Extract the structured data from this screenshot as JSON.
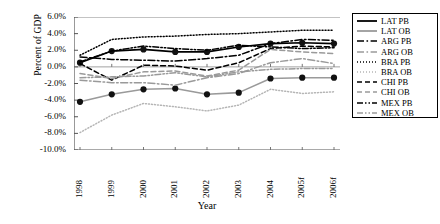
{
  "chart_data": {
    "type": "line",
    "title": "",
    "xlabel": "Year",
    "ylabel": "Percent of GDP",
    "grid": false,
    "legend_position": "right",
    "x": [
      "1998",
      "1999",
      "2000",
      "2001",
      "2002",
      "2003",
      "2004",
      "2005f",
      "2006f"
    ],
    "ylim": [
      -10.0,
      6.0
    ],
    "ytick_labels": [
      "6.0%",
      "4.0%",
      "2.0%",
      "0.0%",
      "-2.0%",
      "-4.0%",
      "-6.0%",
      "-8.0%",
      "-10.0%"
    ],
    "ytick_values": [
      6.0,
      4.0,
      2.0,
      0.0,
      -2.0,
      -4.0,
      -6.0,
      -8.0,
      -10.0
    ],
    "series": [
      {
        "name": "LAT PB",
        "color": "#000000",
        "style": "solid",
        "markers": true,
        "values": [
          0.5,
          1.9,
          2.1,
          1.8,
          1.8,
          2.4,
          2.8,
          2.9,
          2.8
        ]
      },
      {
        "name": "LAT OB",
        "color": "#9a9a9a",
        "style": "solid",
        "markers": true,
        "values": [
          -4.2,
          -3.3,
          -2.7,
          -2.6,
          -3.3,
          -3.1,
          -1.4,
          -1.3,
          -1.3
        ]
      },
      {
        "name": "ARG PB",
        "color": "#000000",
        "style": "dashdot",
        "markers": false,
        "values": [
          1.2,
          0.9,
          0.8,
          0.7,
          1.0,
          1.4,
          2.8,
          3.3,
          3.2
        ]
      },
      {
        "name": "ARG OB",
        "color": "#9a9a9a",
        "style": "dashdot",
        "markers": false,
        "values": [
          -1.6,
          -1.9,
          -1.9,
          -2.2,
          -1.3,
          -0.8,
          0.5,
          1.0,
          0.4
        ]
      },
      {
        "name": "BRA PB",
        "color": "#000000",
        "style": "dotted",
        "markers": false,
        "values": [
          1.4,
          3.3,
          3.6,
          3.7,
          3.9,
          4.0,
          4.2,
          4.4,
          4.4
        ]
      },
      {
        "name": "BRA OB",
        "color": "#b5b5b5",
        "style": "dotted",
        "markers": false,
        "values": [
          -7.9,
          -5.8,
          -4.4,
          -4.8,
          -5.3,
          -4.6,
          -2.7,
          -3.2,
          -3.0
        ]
      },
      {
        "name": "CHI PB",
        "color": "#000000",
        "style": "dashed",
        "markers": false,
        "values": [
          0.4,
          -1.6,
          0.2,
          0.1,
          -0.4,
          0.5,
          2.2,
          2.5,
          2.4
        ]
      },
      {
        "name": "CHI OB",
        "color": "#9a9a9a",
        "style": "dashed",
        "markers": false,
        "values": [
          -0.8,
          -1.4,
          -0.6,
          -0.5,
          -1.1,
          -0.4,
          2.1,
          1.8,
          1.6
        ]
      },
      {
        "name": "MEX PB",
        "color": "#000000",
        "style": "dashdotdot",
        "markers": false,
        "values": [
          0.6,
          1.9,
          2.5,
          2.2,
          2.0,
          2.6,
          2.4,
          2.2,
          2.3
        ]
      },
      {
        "name": "MEX OB",
        "color": "#9a9a9a",
        "style": "dashdotdot",
        "markers": false,
        "values": [
          -1.3,
          -1.2,
          -1.1,
          -0.7,
          -1.2,
          -0.6,
          -0.3,
          -0.2,
          -0.2
        ]
      }
    ]
  },
  "legend": {
    "items": [
      {
        "label": "LAT PB"
      },
      {
        "label": "LAT OB"
      },
      {
        "label": "ARG PB"
      },
      {
        "label": "ARG OB"
      },
      {
        "label": "BRA PB"
      },
      {
        "label": "BRA OB"
      },
      {
        "label": "CHI PB"
      },
      {
        "label": "CHI OB"
      },
      {
        "label": "MEX PB"
      },
      {
        "label": "MEX OB"
      }
    ]
  }
}
